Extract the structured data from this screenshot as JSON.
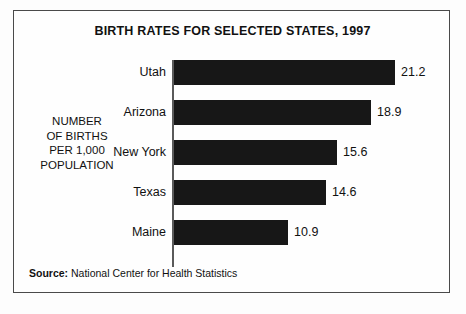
{
  "figure": {
    "title": "BIRTH RATES FOR SELECTED STATES, 1997",
    "axis_caption_lines": [
      "NUMBER",
      "OF BIRTHS",
      "PER 1,000",
      "POPULATION"
    ],
    "source_label": "Source:",
    "source_text": "National Center for Health Statistics",
    "colors": {
      "bar": "#171717",
      "border": "#4a4a4a",
      "axis": "#5a5a5a",
      "background": "#fefefe",
      "text": "#111111"
    }
  },
  "chart_data": {
    "type": "bar",
    "orientation": "horizontal",
    "title": "BIRTH RATES FOR SELECTED STATES, 1997",
    "xlabel": "",
    "ylabel": "NUMBER OF BIRTHS PER 1,000 POPULATION",
    "categories": [
      "Utah",
      "Arizona",
      "New York",
      "Texas",
      "Maine"
    ],
    "values": [
      21.2,
      18.9,
      15.6,
      14.6,
      10.9
    ],
    "value_labels": [
      "21.2",
      "18.9",
      "15.6",
      "14.6",
      "10.9"
    ],
    "xlim": [
      0,
      24
    ],
    "grid": false,
    "legend": false,
    "source": "Source: National Center for Health Statistics"
  }
}
